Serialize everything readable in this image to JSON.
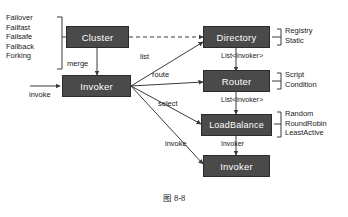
{
  "figure": {
    "caption": "图 8-8"
  },
  "nodes": [
    {
      "id": "cluster",
      "label": "Cluster"
    },
    {
      "id": "invoker_left",
      "label": "Invoker"
    },
    {
      "id": "directory",
      "label": "Directory"
    },
    {
      "id": "router",
      "label": "Router"
    },
    {
      "id": "loadbalance",
      "label": "LoadBalance"
    },
    {
      "id": "invoker_bottom",
      "label": "Invoker"
    }
  ],
  "edge_labels": {
    "merge": "merge",
    "invoke_left": "invoke",
    "list": "list",
    "route": "route",
    "select": "select",
    "invoke_bottom": "invoke"
  },
  "type_labels": {
    "dir_to_router": "List<Invoker>",
    "router_to_lb": "List<Invoker>",
    "lb_to_invoker": "Invoker"
  },
  "option_groups": {
    "cluster_strategies": {
      "items": [
        "Failover",
        "Failfast",
        "Failsafe",
        "Failback",
        "Forking"
      ]
    },
    "directory_types": {
      "items": [
        "Registry",
        "Static"
      ]
    },
    "router_types": {
      "items": [
        "Script",
        "Condition"
      ]
    },
    "loadbalance_types": {
      "items": [
        "Random",
        "RoundRobin",
        "LeastActive"
      ]
    }
  },
  "colors": {
    "node_fill": "#4a4a4a",
    "node_border": "#2b2b2b",
    "node_text": "#ffffff",
    "line": "#3a3a3a",
    "background": "#ffffff"
  }
}
